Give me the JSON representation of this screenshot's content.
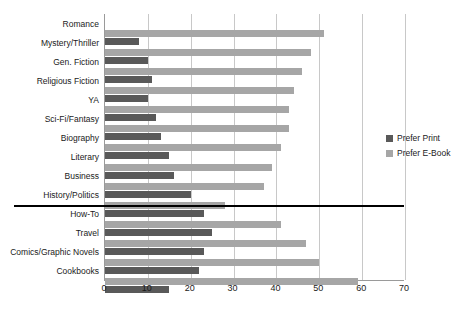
{
  "chart_data": {
    "type": "bar",
    "orientation": "horizontal",
    "title": "",
    "xlabel": "",
    "ylabel": "",
    "xlim": [
      0,
      70
    ],
    "xticks": [
      0,
      10,
      20,
      30,
      40,
      50,
      60,
      70
    ],
    "grid": true,
    "legend_position": "right",
    "categories": [
      "Romance",
      "Mystery/Thriller",
      "Gen. Fiction",
      "Religious Fiction",
      "YA",
      "Sci-Fi/Fantasy",
      "Biography",
      "Literary",
      "Business",
      "History/Politics",
      "How-To",
      "Travel",
      "Comics/Graphic Novels",
      "Cookbooks"
    ],
    "series": [
      {
        "name": "Prefer Print",
        "color": "#595959",
        "values": [
          8,
          10,
          11,
          10,
          12,
          13,
          15,
          16,
          20,
          23,
          25,
          23,
          22,
          15
        ]
      },
      {
        "name": "Prefer E-Book",
        "color": "#a6a6a6",
        "values": [
          51,
          48,
          46,
          44,
          43,
          43,
          41,
          39,
          37,
          28,
          41,
          47,
          50,
          59
        ]
      }
    ],
    "annotations": [
      {
        "name": "separator-line",
        "description": "horizontal black rule between History/Politics and How-To"
      }
    ]
  },
  "legend": {
    "items": [
      {
        "label": "Prefer Print",
        "color": "#595959"
      },
      {
        "label": "Prefer E-Book",
        "color": "#a6a6a6"
      }
    ]
  }
}
